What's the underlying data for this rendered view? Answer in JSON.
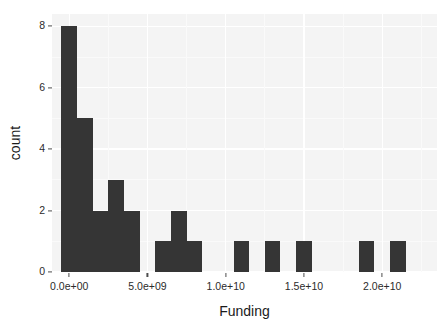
{
  "chart_data": {
    "type": "bar",
    "chart_subtype": "histogram",
    "title": "",
    "subtitle": "",
    "xlabel": "Funding",
    "ylabel": "count",
    "grid": true,
    "legend": "none",
    "xlim": [
      -1100000000,
      23500000000
    ],
    "ylim": [
      0,
      8.4
    ],
    "binwidth": 1000000000,
    "xtick_labels": [
      "0.0e+00",
      "5.0e+09",
      "1.0e+10",
      "1.5e+10",
      "2.0e+10"
    ],
    "xtick_values": [
      0,
      5000000000,
      10000000000,
      15000000000,
      20000000000
    ],
    "ytick_labels": [
      "0",
      "2",
      "4",
      "6",
      "8"
    ],
    "ytick_values": [
      0,
      2,
      4,
      6,
      8
    ],
    "bin_centers": [
      0,
      1000000000,
      2000000000,
      3000000000,
      4000000000,
      5000000000,
      6000000000,
      7000000000,
      8000000000,
      9000000000,
      10000000000,
      11000000000,
      12000000000,
      13000000000,
      14000000000,
      15000000000,
      16000000000,
      17000000000,
      18000000000,
      19000000000,
      20000000000,
      21000000000,
      22000000000
    ],
    "values": [
      8,
      5,
      2,
      3,
      2,
      0,
      1,
      2,
      1,
      0,
      0,
      1,
      0,
      1,
      0,
      1,
      0,
      0,
      0,
      1,
      0,
      1,
      0
    ],
    "categories": [
      "0.0e+00",
      "1.0e+09",
      "2.0e+09",
      "3.0e+09",
      "4.0e+09",
      "5.0e+09",
      "6.0e+09",
      "7.0e+09",
      "8.0e+09",
      "9.0e+09",
      "1.0e+10",
      "1.1e+10",
      "1.2e+10",
      "1.3e+10",
      "1.4e+10",
      "1.5e+10",
      "1.6e+10",
      "1.7e+10",
      "1.8e+10",
      "1.9e+10",
      "2.0e+10",
      "2.1e+10",
      "2.2e+10"
    ],
    "bar_color": "#353535",
    "panel_background": "#f4f4f4",
    "gridline_color": "#ffffff"
  }
}
